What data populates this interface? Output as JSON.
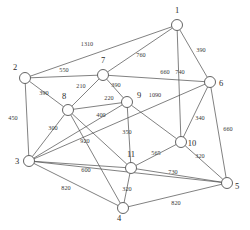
{
  "diagram": {
    "type": "undirected-weighted-network-graph",
    "width": 250,
    "height": 230,
    "background_color": "#ffffff",
    "node_color": "#ffffff",
    "node_stroke_color": "#3c3c3c",
    "edge_color": "#4a4a4a",
    "label_color": "#2b2b2b",
    "node_radius": 5.5,
    "nodes": [
      {
        "id": "1",
        "label": "1",
        "x": 177,
        "y": 25,
        "label_x": 177,
        "label_y": 13
      },
      {
        "id": "2",
        "label": "2",
        "x": 25,
        "y": 78,
        "label_x": 15,
        "label_y": 70
      },
      {
        "id": "3",
        "label": "3",
        "x": 29,
        "y": 161,
        "label_x": 17,
        "label_y": 164
      },
      {
        "id": "4",
        "label": "4",
        "x": 123,
        "y": 208,
        "label_x": 119,
        "label_y": 221
      },
      {
        "id": "5",
        "label": "5",
        "x": 227,
        "y": 183,
        "label_x": 237,
        "label_y": 189
      },
      {
        "id": "6",
        "label": "6",
        "x": 210,
        "y": 82,
        "label_x": 221,
        "label_y": 86
      },
      {
        "id": "7",
        "label": "7",
        "x": 103,
        "y": 75,
        "label_x": 103,
        "label_y": 63
      },
      {
        "id": "8",
        "label": "8",
        "x": 68,
        "y": 110,
        "label_x": 64,
        "label_y": 99
      },
      {
        "id": "9",
        "label": "9",
        "x": 127,
        "y": 102,
        "label_x": 139,
        "label_y": 98
      },
      {
        "id": "10",
        "label": "10",
        "x": 181,
        "y": 142,
        "label_x": 192,
        "label_y": 146
      },
      {
        "id": "11",
        "label": "11",
        "x": 131,
        "y": 168,
        "label_x": 131,
        "label_y": 157
      }
    ],
    "edges": [
      {
        "from": "1",
        "to": "2",
        "weight": "1310",
        "label_x": 87,
        "label_y": 46
      },
      {
        "from": "1",
        "to": "7",
        "weight": "760",
        "label_x": 141,
        "label_y": 57
      },
      {
        "from": "1",
        "to": "6",
        "weight": "390",
        "label_x": 201,
        "label_y": 52
      },
      {
        "from": "1",
        "to": "10",
        "weight": "740",
        "label_x": 180,
        "label_y": 74
      },
      {
        "from": "2",
        "to": "7",
        "weight": "550",
        "label_x": 64,
        "label_y": 72
      },
      {
        "from": "2",
        "to": "8",
        "weight": "390",
        "label_x": 44,
        "label_y": 95
      },
      {
        "from": "2",
        "to": "3",
        "weight": "450",
        "label_x": 13,
        "label_y": 120
      },
      {
        "from": "7",
        "to": "8",
        "weight": "210",
        "label_x": 81,
        "label_y": 88
      },
      {
        "from": "7",
        "to": "9",
        "weight": "390",
        "label_x": 116,
        "label_y": 87
      },
      {
        "from": "7",
        "to": "6",
        "weight": "660",
        "label_x": 165,
        "label_y": 74
      },
      {
        "from": "8",
        "to": "9",
        "weight": "220",
        "label_x": 109,
        "label_y": 100
      },
      {
        "from": "8",
        "to": "3",
        "weight": "300",
        "label_x": 53,
        "label_y": 130
      },
      {
        "from": "8",
        "to": "11",
        "weight": "400",
        "label_x": 101,
        "label_y": 117
      },
      {
        "from": "9",
        "to": "3",
        "weight": "920",
        "label_x": 85,
        "label_y": 143
      },
      {
        "from": "9",
        "to": "11",
        "weight": "350",
        "label_x": 127,
        "label_y": 134
      },
      {
        "from": "9",
        "to": "10",
        "weight": "1090",
        "label_x": 155,
        "label_y": 97
      },
      {
        "from": "6",
        "to": "3",
        "weight": "",
        "label_x": 0,
        "label_y": 0
      },
      {
        "from": "6",
        "to": "10",
        "weight": "340",
        "label_x": 200,
        "label_y": 120
      },
      {
        "from": "6",
        "to": "5",
        "weight": "660",
        "label_x": 228,
        "label_y": 131
      },
      {
        "from": "10",
        "to": "11",
        "weight": "565",
        "label_x": 156,
        "label_y": 155
      },
      {
        "from": "10",
        "to": "5",
        "weight": "320",
        "label_x": 200,
        "label_y": 158
      },
      {
        "from": "11",
        "to": "3",
        "weight": "600",
        "label_x": 86,
        "label_y": 172
      },
      {
        "from": "11",
        "to": "4",
        "weight": "320",
        "label_x": 127,
        "label_y": 191
      },
      {
        "from": "11",
        "to": "5",
        "weight": "730",
        "label_x": 173,
        "label_y": 174
      },
      {
        "from": "3",
        "to": "4",
        "weight": "820",
        "label_x": 66,
        "label_y": 190
      },
      {
        "from": "4",
        "to": "5",
        "weight": "820",
        "label_x": 176,
        "label_y": 205
      },
      {
        "from": "3",
        "to": "5",
        "weight": "",
        "label_x": 0,
        "label_y": 0
      },
      {
        "from": "8",
        "to": "4",
        "weight": "",
        "label_x": 0,
        "label_y": 0
      }
    ]
  }
}
